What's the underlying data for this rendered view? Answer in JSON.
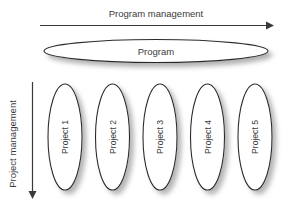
{
  "diagram": {
    "title_axis_horizontal": "Program management",
    "title_axis_vertical": "Project management",
    "program": {
      "label": "Program"
    },
    "projects": [
      {
        "label": "Project 1"
      },
      {
        "label": "Project 2"
      },
      {
        "label": "Project 3"
      },
      {
        "label": "Project 4"
      },
      {
        "label": "Project 5"
      }
    ],
    "icons": {
      "horizontal_arrow": "arrow-right-icon",
      "vertical_arrow": "arrow-down-icon"
    },
    "colors": {
      "background": "#ffffff",
      "shape_fill": "#ffffff",
      "shape_stroke": "#2b2b2b",
      "text": "#3a3a3a",
      "arrow": "#3a3a3a",
      "shadow": "#b4b4b4"
    }
  }
}
